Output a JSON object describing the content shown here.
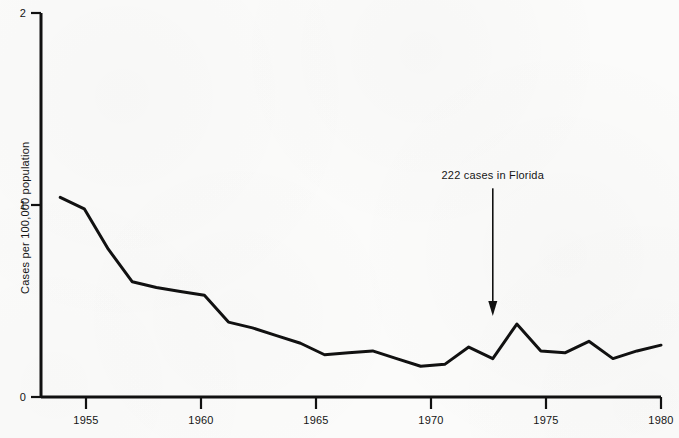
{
  "chart_data": {
    "type": "line",
    "title": "",
    "xlabel": "",
    "ylabel": "Cases per 100,000 population",
    "xlim": [
      1954.2,
      1980
    ],
    "ylim": [
      0,
      2
    ],
    "xticks": [
      1955,
      1960,
      1965,
      1970,
      1975,
      1980
    ],
    "xticklabels": [
      "1955",
      "1960",
      "1965",
      "1970",
      "1975",
      "1980"
    ],
    "yticks": [
      0,
      1,
      2
    ],
    "yticklabels": [
      "0",
      "1",
      "2"
    ],
    "grid": false,
    "legend": null,
    "line_color": "#111111",
    "x": [
      1955,
      1956,
      1957,
      1958,
      1959,
      1960,
      1961,
      1962,
      1963,
      1964,
      1965,
      1966,
      1967,
      1968,
      1969,
      1970,
      1971,
      1972,
      1973,
      1974,
      1975,
      1976,
      1977,
      1978,
      1979,
      1980
    ],
    "values": [
      1.04,
      0.98,
      0.77,
      0.6,
      0.57,
      0.55,
      0.53,
      0.39,
      0.36,
      0.32,
      0.28,
      0.22,
      0.23,
      0.24,
      0.2,
      0.16,
      0.17,
      0.26,
      0.2,
      0.38,
      0.24,
      0.23,
      0.29,
      0.2,
      0.24,
      0.27
    ],
    "annotations": [
      {
        "text": "222 cases in Florida",
        "label_x": 1973,
        "label_y": 1.04,
        "point_x": 1973,
        "point_y": 0.38,
        "arrow": "down"
      }
    ]
  }
}
